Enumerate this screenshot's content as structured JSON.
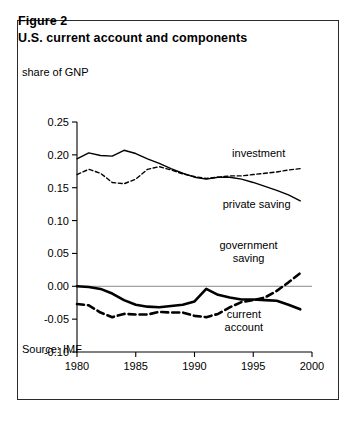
{
  "figure": {
    "label": "Figure 2",
    "title": "U.S. current account and components",
    "source": "Source: IMF",
    "axis_note": "share of GNP"
  },
  "chart_data": {
    "type": "line",
    "title": "U.S. current account and components",
    "subtitle": "Figure 2",
    "xlabel": "",
    "ylabel": "share of GNP",
    "xlim": [
      1980,
      2000
    ],
    "ylim": [
      -0.1,
      0.25
    ],
    "xticks": [
      1980,
      1985,
      1990,
      1995,
      2000
    ],
    "xticklabels": [
      "1980",
      "1985",
      "1990",
      "1995",
      "2000"
    ],
    "yticks": [
      -0.1,
      -0.05,
      0.0,
      0.05,
      0.1,
      0.15,
      0.2,
      0.25
    ],
    "yticklabels": [
      "-0.10",
      "-0.05",
      "0.00",
      "0.05",
      "0.10",
      "0.15",
      "0.20",
      "0.25"
    ],
    "grid": false,
    "zero_line": true,
    "legend": "inline-annotations",
    "annotations": [
      {
        "text": "investment",
        "x": 1993.2,
        "y": 0.196,
        "series": "investment"
      },
      {
        "text": "private saving",
        "x": 1992.4,
        "y": 0.119,
        "series": "private saving"
      },
      {
        "text": "government saving",
        "x": 1994.6,
        "y": 0.057,
        "series": "government saving"
      },
      {
        "text": "current account",
        "x": 1994.2,
        "y": -0.049,
        "series": "current account"
      }
    ],
    "x": [
      1980,
      1981,
      1982,
      1983,
      1984,
      1985,
      1986,
      1987,
      1988,
      1989,
      1990,
      1991,
      1992,
      1993,
      1994,
      1995,
      1996,
      1997,
      1998,
      1999
    ],
    "series": [
      {
        "name": "investment",
        "style": "solid",
        "width": "thin",
        "color": "#000000",
        "values": [
          0.194,
          0.203,
          0.199,
          0.198,
          0.207,
          0.202,
          0.194,
          0.187,
          0.179,
          0.172,
          0.166,
          0.163,
          0.166,
          0.166,
          0.163,
          0.158,
          0.152,
          0.146,
          0.139,
          0.13
        ]
      },
      {
        "name": "private saving",
        "style": "dashed",
        "width": "thin",
        "color": "#000000",
        "values": [
          0.17,
          0.178,
          0.172,
          0.158,
          0.156,
          0.163,
          0.178,
          0.182,
          0.177,
          0.171,
          0.167,
          0.164,
          0.166,
          0.168,
          0.168,
          0.17,
          0.172,
          0.174,
          0.177,
          0.179
        ]
      },
      {
        "name": "current account",
        "style": "solid",
        "width": "bold",
        "color": "#000000",
        "values": [
          0.0,
          -0.001,
          -0.004,
          -0.011,
          -0.021,
          -0.028,
          -0.031,
          -0.032,
          -0.03,
          -0.028,
          -0.023,
          -0.004,
          -0.013,
          -0.017,
          -0.02,
          -0.02,
          -0.021,
          -0.022,
          -0.028,
          -0.035
        ]
      },
      {
        "name": "government saving",
        "style": "dashed",
        "width": "bold",
        "color": "#000000",
        "values": [
          -0.027,
          -0.029,
          -0.04,
          -0.047,
          -0.042,
          -0.043,
          -0.043,
          -0.039,
          -0.04,
          -0.04,
          -0.045,
          -0.047,
          -0.042,
          -0.032,
          -0.024,
          -0.021,
          -0.017,
          -0.007,
          0.006,
          0.02
        ]
      }
    ]
  }
}
